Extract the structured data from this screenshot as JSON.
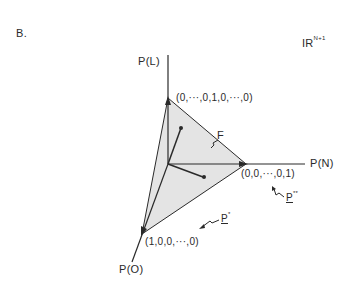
{
  "figure": {
    "panel_label": "B.",
    "space_label": "IR",
    "space_superscript": "N+1",
    "axes": {
      "vertical": "P(L)",
      "horizontal": "P(N)",
      "diagonal": "P(O)"
    },
    "vertices": {
      "top": "(0,···,0,1,0,···,0)",
      "right": "(0,0,···,0,1)",
      "bottom_left": "(1,0,0,···,0)"
    },
    "annotations": {
      "face": "F",
      "p_star": "P",
      "p_star_sup": "*",
      "p_double_star": "P",
      "p_double_star_sup": "**"
    },
    "colors": {
      "line": "#2a2a2a",
      "fill": "#e4e4e4",
      "background": "#ffffff"
    }
  }
}
